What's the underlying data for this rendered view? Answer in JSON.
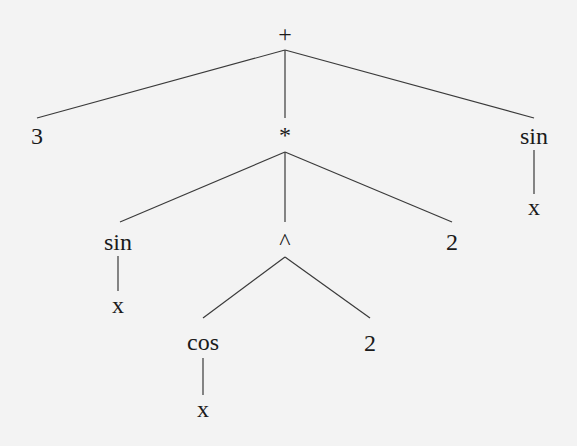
{
  "diagram": {
    "type": "expression-tree",
    "expression": "3 + sin(x)*cos(x)^2*2 + sin(x)",
    "background": "#f3f3f3",
    "line_color": "#3a3a3a",
    "text_color": "#1a1a1a",
    "nodes": [
      {
        "id": "plus",
        "label": "+",
        "x": 285,
        "y": 34
      },
      {
        "id": "three",
        "label": "3",
        "x": 37,
        "y": 136
      },
      {
        "id": "times",
        "label": "*",
        "x": 285,
        "y": 135
      },
      {
        "id": "sin-right",
        "label": "sin",
        "x": 534,
        "y": 136
      },
      {
        "id": "x-right",
        "label": "x",
        "x": 534,
        "y": 207
      },
      {
        "id": "sin-left",
        "label": "sin",
        "x": 118,
        "y": 242
      },
      {
        "id": "pow",
        "label": "^",
        "x": 285,
        "y": 241
      },
      {
        "id": "two-mid",
        "label": "2",
        "x": 452,
        "y": 242
      },
      {
        "id": "x-left",
        "label": "x",
        "x": 118,
        "y": 305
      },
      {
        "id": "cos",
        "label": "cos",
        "x": 203,
        "y": 342
      },
      {
        "id": "two-pow",
        "label": "2",
        "x": 370,
        "y": 343
      },
      {
        "id": "x-cos",
        "label": "x",
        "x": 203,
        "y": 409
      }
    ],
    "edges": [
      {
        "from": "plus",
        "to": "three",
        "x1": 285,
        "y1": 50,
        "x2": 37,
        "y2": 118
      },
      {
        "from": "plus",
        "to": "times",
        "x1": 285,
        "y1": 50,
        "x2": 285,
        "y2": 118
      },
      {
        "from": "plus",
        "to": "sin-right",
        "x1": 285,
        "y1": 50,
        "x2": 534,
        "y2": 118
      },
      {
        "from": "sin-right",
        "to": "x-right",
        "x1": 534,
        "y1": 150,
        "x2": 534,
        "y2": 194
      },
      {
        "from": "times",
        "to": "sin-left",
        "x1": 285,
        "y1": 152,
        "x2": 120,
        "y2": 222
      },
      {
        "from": "times",
        "to": "pow",
        "x1": 285,
        "y1": 152,
        "x2": 285,
        "y2": 222
      },
      {
        "from": "times",
        "to": "two-mid",
        "x1": 285,
        "y1": 152,
        "x2": 452,
        "y2": 222
      },
      {
        "from": "sin-left",
        "to": "x-left",
        "x1": 118,
        "y1": 256,
        "x2": 118,
        "y2": 291
      },
      {
        "from": "pow",
        "to": "cos",
        "x1": 285,
        "y1": 257,
        "x2": 203,
        "y2": 318
      },
      {
        "from": "pow",
        "to": "two-pow",
        "x1": 285,
        "y1": 257,
        "x2": 370,
        "y2": 318
      },
      {
        "from": "cos",
        "to": "x-cos",
        "x1": 203,
        "y1": 358,
        "x2": 203,
        "y2": 395
      }
    ]
  }
}
